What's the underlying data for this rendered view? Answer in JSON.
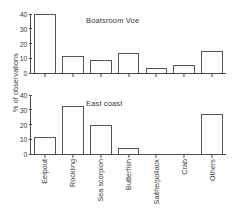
{
  "figure": {
    "ylabel": "% of observations"
  },
  "chart_data": [
    {
      "type": "bar",
      "title": "Boatsroom Voe",
      "xlabel": "",
      "ylabel": "% of observations",
      "ylim": [
        0,
        40
      ],
      "yticks": [
        0,
        10,
        20,
        30,
        40
      ],
      "ytick_labels": [
        "0",
        "10",
        "20",
        "30",
        "40"
      ],
      "grid": false,
      "legend": "none",
      "categories": [
        "Eelpout",
        "Rockling",
        "Sea scorpion",
        "Butterfish",
        "Saithe/pollack",
        "Crab",
        "Others"
      ],
      "values": [
        40,
        11.5,
        9,
        13.5,
        3.5,
        5.5,
        15
      ]
    },
    {
      "type": "bar",
      "title": "East coast",
      "xlabel": "",
      "ylabel": "% of observations",
      "ylim": [
        0,
        40
      ],
      "yticks": [
        0,
        10,
        20,
        30,
        40
      ],
      "ytick_labels": [
        "0",
        "10",
        "20",
        "30",
        "40"
      ],
      "grid": false,
      "legend": "none",
      "categories": [
        "Eelpout",
        "Rockling",
        "Sea scorpion",
        "Butterfish",
        "Saithe/pollack",
        "Crab",
        "Others"
      ],
      "values": [
        11.5,
        32.5,
        20,
        4,
        0,
        0,
        27
      ]
    }
  ]
}
